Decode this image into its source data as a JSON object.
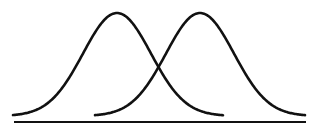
{
  "diagram": {
    "type": "overlapping-normal-distributions",
    "stroke_color": "#111111",
    "background": "#ffffff",
    "baseline": {
      "x1": 14,
      "x2": 306,
      "y": 122,
      "width": 2
    },
    "curves": [
      {
        "name": "left-distribution",
        "mean_x": 117,
        "peak_y": 13,
        "start_x": 13,
        "end_x": 223,
        "base_y": 116,
        "sigma": 34
      },
      {
        "name": "right-distribution",
        "mean_x": 200,
        "peak_y": 13,
        "start_x": 95,
        "end_x": 305,
        "base_y": 116,
        "sigma": 34
      }
    ]
  }
}
